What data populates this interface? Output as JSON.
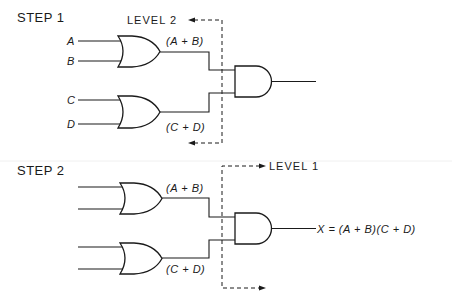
{
  "diagram": {
    "type": "logic-circuit-levels",
    "step1": {
      "title": "STEP 1",
      "level_label": "LEVEL 2",
      "inputs": [
        "A",
        "B",
        "C",
        "D"
      ],
      "gate1_output": "(A + B)",
      "gate2_output": "(C + D)",
      "gates": [
        {
          "id": "or1",
          "type": "OR",
          "inputs": [
            "A",
            "B"
          ],
          "output": "(A + B)"
        },
        {
          "id": "or2",
          "type": "OR",
          "inputs": [
            "C",
            "D"
          ],
          "output": "(C + D)"
        },
        {
          "id": "and1",
          "type": "AND",
          "inputs": [
            "(A + B)",
            "(C + D)"
          ],
          "output": ""
        }
      ]
    },
    "step2": {
      "title": "STEP 2",
      "level_label": "LEVEL 1",
      "gate1_output": "(A + B)",
      "gate2_output": "(C + D)",
      "final_output": "X = (A + B)(C + D)",
      "gates": [
        {
          "id": "or1",
          "type": "OR",
          "inputs": [
            "",
            ""
          ],
          "output": "(A + B)"
        },
        {
          "id": "or2",
          "type": "OR",
          "inputs": [
            "",
            ""
          ],
          "output": "(C + D)"
        },
        {
          "id": "and1",
          "type": "AND",
          "inputs": [
            "(A + B)",
            "(C + D)"
          ],
          "output": "X = (A + B)(C + D)"
        }
      ]
    }
  }
}
